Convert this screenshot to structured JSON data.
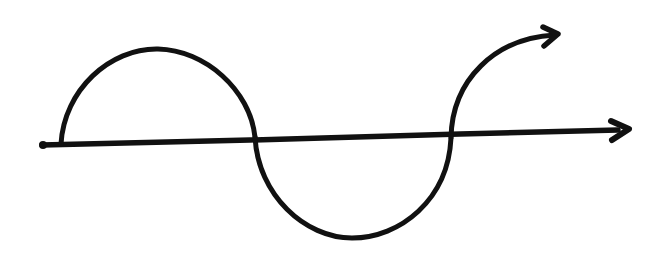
{
  "diagram": {
    "title": "Hand-drawn sine-like wave crossing a horizontal axis",
    "stroke_color": "#111111",
    "background": "#ffffff",
    "axis": {
      "label": "horizontal axis arrow",
      "direction": "right"
    },
    "wave": {
      "label": "curve with one crest above and one trough below the axis, ending in an arrow pointing up-right",
      "segments": [
        "crest above axis",
        "trough below axis",
        "rising tail with arrowhead"
      ]
    }
  }
}
